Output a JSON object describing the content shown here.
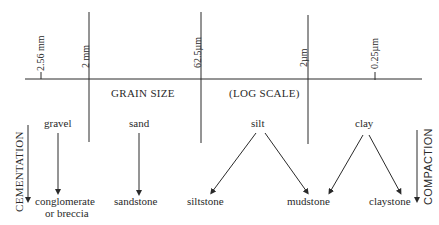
{
  "scale": {
    "title": "GRAIN SIZE",
    "subtitle": "(LOG SCALE)",
    "ticks": [
      {
        "label": "2.56 mm"
      },
      {
        "label": "2 mm"
      },
      {
        "label": "62.5µm"
      },
      {
        "label": "2µm"
      },
      {
        "label": "0.25µm"
      }
    ]
  },
  "sediments": [
    {
      "label": "gravel"
    },
    {
      "label": "sand"
    },
    {
      "label": "silt"
    },
    {
      "label": "clay"
    }
  ],
  "rocks": [
    {
      "label": "conglomerate",
      "label2": "or breccia"
    },
    {
      "label": "sandstone"
    },
    {
      "label": "siltstone"
    },
    {
      "label": "mudstone"
    },
    {
      "label": "claystone"
    }
  ],
  "processes": {
    "left": "CEMENTATION",
    "right": "COMPACTION"
  },
  "colors": {
    "ink": "#2a2a2a",
    "background": "#ffffff"
  }
}
